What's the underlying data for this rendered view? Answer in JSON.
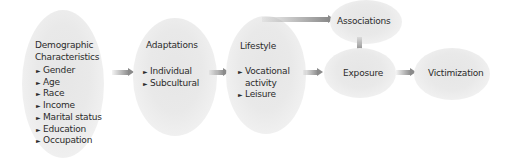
{
  "nodes": {
    "demographic": {
      "title_line1": "Demographic",
      "title_line2": "Characteristics",
      "items": [
        "Gender",
        "Age",
        "Race",
        "Income",
        "Marital status",
        "Education",
        "Occupation"
      ]
    },
    "adaptations": {
      "title": "Adaptations",
      "items": [
        "Individual",
        "Subcultural"
      ]
    },
    "lifestyle": {
      "title": "Lifestyle",
      "item1_line1": "Vocational",
      "item1_line2": "activity",
      "item2": "Leisure"
    },
    "associations": {
      "title": "Associations"
    },
    "exposure": {
      "title": "Exposure"
    },
    "victimization": {
      "title": "Victimization"
    }
  },
  "bullet_glyph": "►",
  "edges": [
    {
      "from": "Demographic Characteristics",
      "to": "Adaptations"
    },
    {
      "from": "Adaptations",
      "to": "Lifestyle"
    },
    {
      "from": "Lifestyle",
      "to": "Associations"
    },
    {
      "from": "Lifestyle",
      "to": "Exposure"
    },
    {
      "from": "Associations",
      "to": "Exposure"
    },
    {
      "from": "Exposure",
      "to": "Victimization"
    }
  ],
  "colors": {
    "node_fill": "#e8e8e8",
    "arrow": "#8a8a8a",
    "text": "#2b2b2b"
  }
}
